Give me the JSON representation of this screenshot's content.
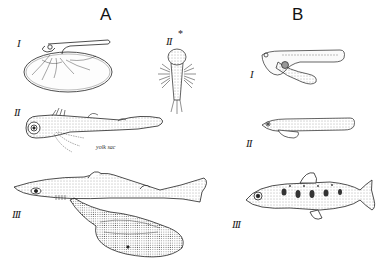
{
  "figure": {
    "panels": [
      {
        "letter": "A",
        "stages": [
          {
            "numeral": "I",
            "subject": "embryo on large yolk sac"
          },
          {
            "numeral": "II",
            "subject": "embryo with external gills, dorsal view",
            "marker": "*"
          },
          {
            "numeral": "II",
            "subject": "embryo with external gills, lateral view",
            "annotation": "yolk sac"
          },
          {
            "numeral": "III",
            "subject": "young shark with yolk sac"
          }
        ]
      },
      {
        "letter": "B",
        "stages": [
          {
            "numeral": "I",
            "subject": "newly hatched larva with yolk sac"
          },
          {
            "numeral": "II",
            "subject": "larva with reduced yolk sac"
          },
          {
            "numeral": "III",
            "subject": "young spotted fish (parr)"
          }
        ]
      }
    ],
    "labels": {
      "A": "A",
      "B": "B",
      "A_I": "I",
      "A_II_dorsal": "II",
      "A_II_marker": "*",
      "A_II_lateral": "II",
      "A_III": "III",
      "B_I": "I",
      "B_II": "II",
      "B_III": "III",
      "yolk_sac": "yolk sac"
    },
    "colors": {
      "ink": "#1a1a1a",
      "background": "#ffffff",
      "stipple": "#555555"
    }
  }
}
